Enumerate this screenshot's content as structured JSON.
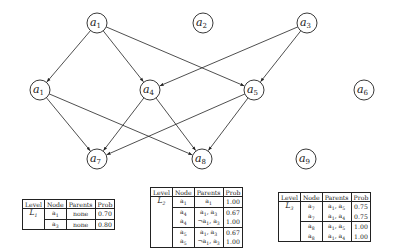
{
  "diagram": {
    "type": "bayesian-network-levels",
    "nodes": [
      {
        "id": "n_a1_top",
        "label": "a",
        "sub": "1",
        "x": 97,
        "y": 23
      },
      {
        "id": "n_a2",
        "label": "a",
        "sub": "2",
        "x": 203,
        "y": 23
      },
      {
        "id": "n_a3",
        "label": "a",
        "sub": "3",
        "x": 307,
        "y": 23
      },
      {
        "id": "n_a1_mid",
        "label": "a",
        "sub": "1",
        "x": 40,
        "y": 90
      },
      {
        "id": "n_a4",
        "label": "a",
        "sub": "4",
        "x": 150,
        "y": 90
      },
      {
        "id": "n_a5",
        "label": "a",
        "sub": "5",
        "x": 254,
        "y": 90
      },
      {
        "id": "n_a6",
        "label": "a",
        "sub": "6",
        "x": 364,
        "y": 90
      },
      {
        "id": "n_a7",
        "label": "a",
        "sub": "7",
        "x": 97,
        "y": 159
      },
      {
        "id": "n_a8",
        "label": "a",
        "sub": "8",
        "x": 202,
        "y": 159
      },
      {
        "id": "n_a9",
        "label": "a",
        "sub": "9",
        "x": 306,
        "y": 159
      }
    ],
    "edges": [
      {
        "from": "n_a1_top",
        "to": "n_a1_mid"
      },
      {
        "from": "n_a1_top",
        "to": "n_a4"
      },
      {
        "from": "n_a1_top",
        "to": "n_a5"
      },
      {
        "from": "n_a3",
        "to": "n_a4"
      },
      {
        "from": "n_a3",
        "to": "n_a5"
      },
      {
        "from": "n_a1_mid",
        "to": "n_a7"
      },
      {
        "from": "n_a1_mid",
        "to": "n_a8"
      },
      {
        "from": "n_a4",
        "to": "n_a7"
      },
      {
        "from": "n_a4",
        "to": "n_a8"
      },
      {
        "from": "n_a5",
        "to": "n_a7"
      },
      {
        "from": "n_a5",
        "to": "n_a8"
      }
    ],
    "node_radius": 10,
    "stroke_color": "#222222"
  },
  "tables": {
    "headers": [
      "Level",
      "Node",
      "Parents",
      "Prob"
    ],
    "t1": {
      "level": "L",
      "level_sub": "1",
      "rows": [
        {
          "node": "a",
          "node_sub": "1",
          "parents": "none",
          "prob": "0.70"
        },
        {
          "node": "a",
          "node_sub": "3",
          "parents": "none",
          "prob": "0.80"
        }
      ]
    },
    "t2": {
      "level": "L",
      "level_sub": "2",
      "rows": [
        {
          "node": "a",
          "node_sub": "1",
          "parents_html": "a<span class=\"sub\">1</span>",
          "prob": "1.00"
        },
        {
          "node": "a",
          "node_sub": "4",
          "parents_html": "a<span class=\"sub\">1</span>, a<span class=\"sub\">3</span>",
          "prob": "0.67"
        },
        {
          "node": "a",
          "node_sub": "4",
          "parents_html": "¬a<span class=\"sub\">1</span>, a<span class=\"sub\">3</span>",
          "prob": "1.00"
        },
        {
          "node": "a",
          "node_sub": "5",
          "parents_html": "a<span class=\"sub\">1</span>, a<span class=\"sub\">3</span>",
          "prob": "0.67"
        },
        {
          "node": "a",
          "node_sub": "5",
          "parents_html": "¬a<span class=\"sub\">1</span>, a<span class=\"sub\">3</span>",
          "prob": "1.00"
        }
      ]
    },
    "t3": {
      "level": "L",
      "level_sub": "3",
      "rows": [
        {
          "node": "a",
          "node_sub": "7",
          "parents_html": "a<span class=\"sub\">1</span>, a<span class=\"sub\">5</span>",
          "prob": "0.75"
        },
        {
          "node": "a",
          "node_sub": "7",
          "parents_html": "a<span class=\"sub\">1</span>, a<span class=\"sub\">4</span>",
          "prob": "0.75"
        },
        {
          "node": "a",
          "node_sub": "8",
          "parents_html": "a<span class=\"sub\">1</span>, a<span class=\"sub\">5</span>",
          "prob": "1.00"
        },
        {
          "node": "a",
          "node_sub": "8",
          "parents_html": "a<span class=\"sub\">1</span>, a<span class=\"sub\">4</span>",
          "prob": "1.00"
        }
      ]
    }
  }
}
